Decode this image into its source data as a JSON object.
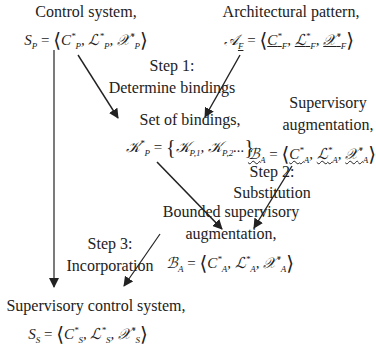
{
  "nodes": {
    "control_system": {
      "label": "Control system,",
      "formula": "S_P = ⟨C*_P, L*_P, X*_P⟩",
      "lhs": "S",
      "lhs_sub": "P"
    },
    "architectural_pattern": {
      "label": "Architectural pattern,",
      "formula": "A_F = ⟨C*_F, L*_F, X*_F⟩",
      "lhs": "A",
      "lhs_sub": "F"
    },
    "set_of_bindings": {
      "label": "Set of bindings,",
      "formula": "K*_P = {K_P,1, K_P,2,...}"
    },
    "supervisory_augmentation": {
      "label_line1": "Supervisory",
      "label_line2": "augmentation,",
      "formula": "B_A = ⟨C*_A, L*_A, X*_A⟩"
    },
    "bounded_supervisory_augmentation": {
      "label_line1": "Bounded supervisory",
      "label_line2": "augmentation,",
      "formula": "B_A = ⟨C*_A, L*_A, X*_A⟩"
    },
    "supervisory_control_system": {
      "label": "Supervisory control system,",
      "formula": "S_S = ⟨C*_S, L*_S, X*_S⟩"
    }
  },
  "steps": {
    "step1": {
      "line1": "Step 1:",
      "line2": "Determine bindings"
    },
    "step2": {
      "line1": "Step 2:",
      "line2": "Substitution"
    },
    "step3": {
      "line1": "Step 3:",
      "line2": "Incorporation"
    }
  },
  "symbols": {
    "S": "S",
    "A": "𝒜",
    "K": "𝒦",
    "B": "ℬ",
    "C": "C",
    "L": "ℒ",
    "X": "𝒳",
    "star": "*",
    "eq": "=",
    "lang": "⟨",
    "rang": "⟩",
    "comma": ",",
    "lbrace": "{",
    "rbrace": "}",
    "dots": "...",
    "P": "P",
    "F": "F",
    "Asub": "A",
    "Ssub": "S",
    "P1": "P,1",
    "P2": "P,2"
  }
}
